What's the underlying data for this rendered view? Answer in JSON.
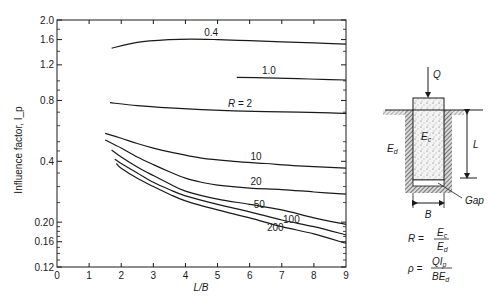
{
  "chart_data": {
    "type": "line",
    "title": "",
    "xlabel": "L/B",
    "ylabel": "Influence factor, I_p",
    "xlim": [
      0,
      9
    ],
    "ylim": [
      0.12,
      2.0
    ],
    "yscale": "log",
    "grid": false,
    "x_ticks": [
      0,
      1,
      2,
      3,
      4,
      5,
      6,
      7,
      8,
      9
    ],
    "x_tick_labels": [
      "0",
      "1",
      "2",
      "3",
      "4",
      "5",
      "6",
      "7",
      "8",
      "9"
    ],
    "y_ticks": [
      0.12,
      0.16,
      0.2,
      0.4,
      0.8,
      1.2,
      1.6,
      2.0
    ],
    "y_tick_labels": [
      "0.12",
      "0.16",
      "0.20",
      "0.4",
      "0.8",
      "1.2",
      "1.6",
      "2.0"
    ],
    "series": [
      {
        "name": "0.4",
        "label": "0.4",
        "x": [
          1.7,
          2.5,
          3.5,
          4.2,
          5,
          6,
          7,
          8,
          9
        ],
        "values": [
          1.45,
          1.55,
          1.6,
          1.61,
          1.6,
          1.58,
          1.56,
          1.54,
          1.52
        ],
        "label_pos": [
          4.8,
          1.67
        ]
      },
      {
        "name": "1.0",
        "label": "1.0",
        "x": [
          5.6,
          6.5,
          7.5,
          8.5,
          9
        ],
        "values": [
          1.04,
          1.035,
          1.025,
          1.015,
          1.01
        ],
        "label_pos": [
          6.6,
          1.08
        ]
      },
      {
        "name": "2",
        "label": "R = 2",
        "x": [
          1.65,
          2.5,
          3.5,
          4.5,
          5.5,
          6.5,
          7.5,
          8.5,
          9
        ],
        "values": [
          0.78,
          0.755,
          0.735,
          0.72,
          0.71,
          0.705,
          0.7,
          0.695,
          0.69
        ],
        "label_pos": [
          5.7,
          0.74
        ]
      },
      {
        "name": "10",
        "label": "10",
        "x": [
          1.5,
          2,
          2.5,
          3,
          3.5,
          4.5,
          5.5,
          6.5,
          7.5,
          9
        ],
        "values": [
          0.55,
          0.52,
          0.49,
          0.465,
          0.445,
          0.415,
          0.4,
          0.39,
          0.38,
          0.37
        ],
        "label_pos": [
          6.2,
          0.405
        ]
      },
      {
        "name": "20",
        "label": "20",
        "x": [
          1.5,
          2,
          2.5,
          3,
          3.5,
          4,
          4.5,
          5,
          6,
          7,
          8,
          9
        ],
        "values": [
          0.51,
          0.465,
          0.42,
          0.385,
          0.355,
          0.33,
          0.315,
          0.305,
          0.295,
          0.29,
          0.282,
          0.275
        ],
        "label_pos": [
          6.2,
          0.307
        ]
      },
      {
        "name": "50",
        "label": "50",
        "x": [
          1.7,
          2,
          2.5,
          3,
          3.5,
          4,
          5,
          6,
          7,
          8,
          9
        ],
        "values": [
          0.455,
          0.42,
          0.375,
          0.34,
          0.31,
          0.285,
          0.26,
          0.245,
          0.23,
          0.21,
          0.195
        ],
        "label_pos": [
          6.3,
          0.235
        ]
      },
      {
        "name": "100",
        "label": "100",
        "x": [
          1.8,
          2,
          2.5,
          3,
          3.5,
          4,
          5,
          6,
          7,
          8,
          9
        ],
        "values": [
          0.41,
          0.39,
          0.35,
          0.315,
          0.29,
          0.27,
          0.245,
          0.225,
          0.205,
          0.19,
          0.173
        ],
        "label_pos": [
          7.3,
          0.198
        ]
      },
      {
        "name": "200",
        "label": "200",
        "x": [
          1.85,
          2,
          2.5,
          3,
          3.5,
          4,
          5,
          6,
          7,
          8,
          9
        ],
        "values": [
          0.39,
          0.37,
          0.33,
          0.3,
          0.275,
          0.255,
          0.23,
          0.21,
          0.19,
          0.175,
          0.157
        ],
        "label_pos": [
          6.8,
          0.18
        ]
      }
    ],
    "legend": "inline curve labels"
  },
  "diagram": {
    "load_label": "Q",
    "pile_label": "E",
    "pile_label_sub": "c",
    "soil_label": "E",
    "soil_label_sub": "d",
    "length_label": "L",
    "width_label": "B",
    "gap_label": "Gap"
  },
  "formulas": {
    "r_lhs": "R =",
    "r_num": "E",
    "r_num_sub": "c",
    "r_den": "E",
    "r_den_sub": "d",
    "rho_lhs": "ρ =",
    "rho_num": "QI",
    "rho_num_sub": "p",
    "rho_den": "BE",
    "rho_den_sub": "d"
  },
  "colors": {
    "ink": "#1a1a1a",
    "background": "#ffffff"
  }
}
